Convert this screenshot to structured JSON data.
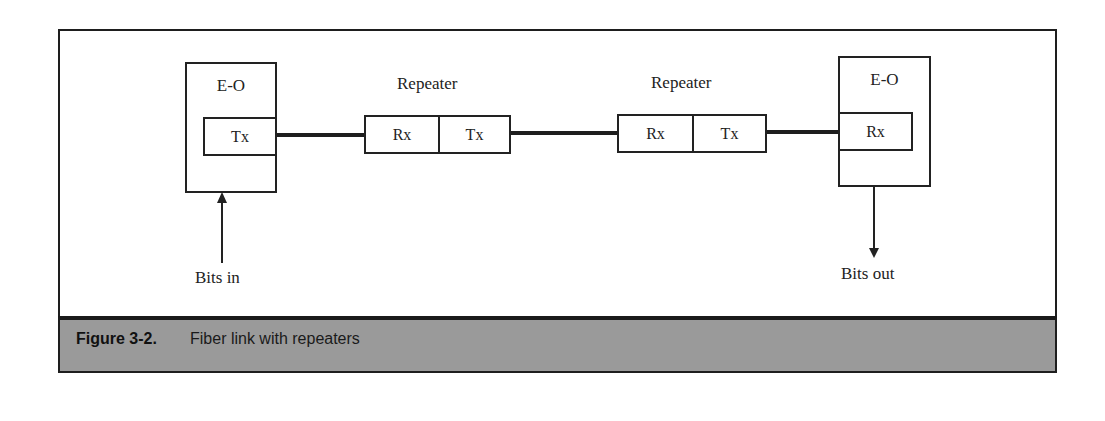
{
  "figure": {
    "number": "Figure 3-2.",
    "caption": "Fiber link with repeaters",
    "colors": {
      "caption_bar": "#9a9a9a",
      "lines": "#1e1e1e",
      "background": "#ffffff"
    }
  },
  "diagram": {
    "transmitter": {
      "title": "E-O",
      "port": "Tx"
    },
    "repeaters": [
      {
        "title": "Repeater",
        "rx": "Rx",
        "tx": "Tx"
      },
      {
        "title": "Repeater",
        "rx": "Rx",
        "tx": "Tx"
      }
    ],
    "receiver": {
      "title": "E-O",
      "port": "Rx"
    },
    "input_label": "Bits in",
    "output_label": "Bits out"
  }
}
